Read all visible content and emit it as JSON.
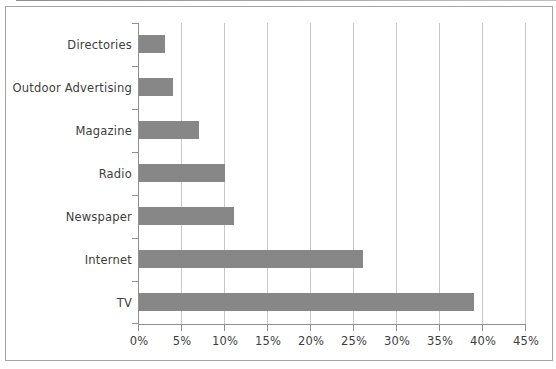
{
  "chart_data": {
    "type": "bar",
    "orientation": "horizontal",
    "title": "",
    "xlabel": "",
    "ylabel": "",
    "categories": [
      "Directories",
      "Outdoor Advertising",
      "Magazine",
      "Radio",
      "Newspaper",
      "Internet",
      "TV"
    ],
    "values": [
      3,
      4,
      7,
      10,
      11,
      26,
      39
    ],
    "value_unit": "percent",
    "xlim": [
      0,
      45
    ],
    "x_tick_values": [
      0,
      5,
      10,
      15,
      20,
      25,
      30,
      35,
      40,
      45
    ],
    "x_tick_labels": [
      "0%",
      "5%",
      "10%",
      "15%",
      "20%",
      "25%",
      "30%",
      "35%",
      "40%",
      "45%"
    ],
    "grid": "vertical",
    "legend": "none",
    "colors": {
      "bar": "#878787",
      "gridline": "#c8c8c8",
      "axis_line": "#8f8f8f",
      "label_text": "#3d3d3d",
      "frame_border": "#a3a3a3",
      "background": "#ffffff"
    }
  }
}
